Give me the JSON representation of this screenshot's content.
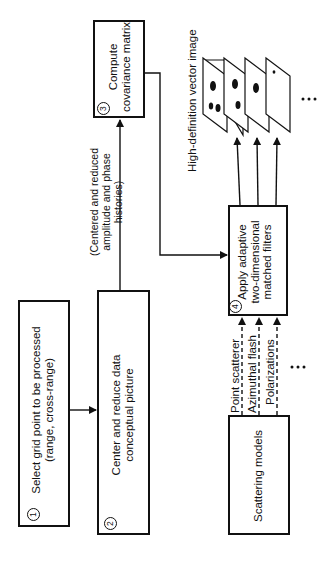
{
  "diagram": {
    "orientation": "rotated -90deg (text reads bottom to top)",
    "steps": [
      {
        "number": "1",
        "label_line1": "Select grid point to be processed",
        "label_line2": "(range, cross-range)"
      },
      {
        "number": "2",
        "label_line1": "Center and reduce data",
        "label_line2": "conceptual picture"
      },
      {
        "number": "3",
        "label_line1": "Compute",
        "label_line2": "covariance matrix"
      },
      {
        "number": "4",
        "label_line1": "Apply adaptive",
        "label_line2": "two-dimensional",
        "label_line3": "matched filters"
      }
    ],
    "scattering_box": {
      "label": "Scattering models"
    },
    "edge_annotation": {
      "line1": "(Centered and reduced",
      "line2": "amplitude and phase",
      "line3": "histories)"
    },
    "model_inputs": [
      {
        "label": "Point scatterer",
        "style": "dashed"
      },
      {
        "label": "Azimuthal flash",
        "style": "dashed"
      },
      {
        "label": "Polarizations",
        "style": "dashed"
      }
    ],
    "model_inputs_ellipsis": "• • •",
    "output_label": "High-definition vector image",
    "output_ellipsis": "• • •",
    "output_planes": 4,
    "edges": [
      {
        "from": "1",
        "to": "2"
      },
      {
        "from": "2",
        "to": "3"
      },
      {
        "from": "3",
        "to": "4"
      },
      {
        "from": "scattering_models",
        "to": "4"
      },
      {
        "from": "4",
        "to": "output_images"
      }
    ]
  }
}
